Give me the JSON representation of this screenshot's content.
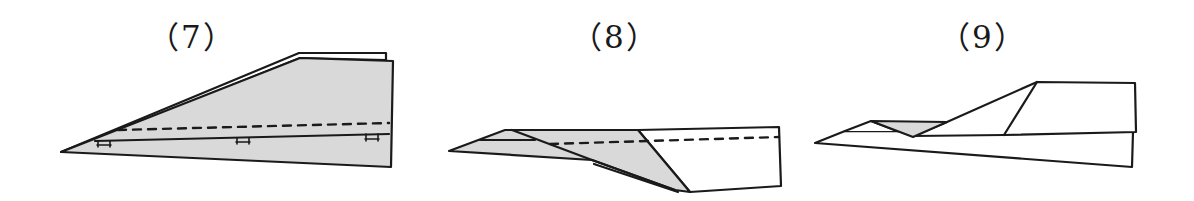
{
  "figure": {
    "colors": {
      "stroke": "#1a1a1a",
      "fill_shaded": "#d9d9d9",
      "fill_paper": "#ffffff",
      "background": "#ffffff"
    },
    "panels": [
      {
        "id": "step-7",
        "label": "（7）",
        "label_pos": [
          148,
          22
        ],
        "elements": [
          "shaded folded layer",
          "dashed fold line",
          "three hinge marks on center crease",
          "double-edged upper outline"
        ]
      },
      {
        "id": "step-8",
        "label": "（8）",
        "label_pos": [
          571,
          22
        ],
        "elements": [
          "shaded diagonal fold flap",
          "dashed fold line",
          "white tail section"
        ]
      },
      {
        "id": "step-9",
        "label": "（9）",
        "label_pos": [
          939,
          22
        ],
        "elements": [
          "small shaded triangle",
          "swept wing outline",
          "completed fuselage"
        ]
      }
    ]
  }
}
